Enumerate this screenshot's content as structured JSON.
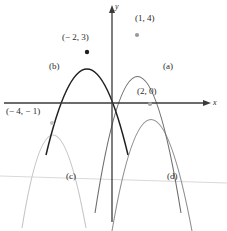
{
  "figure": {
    "background": "#ffffff",
    "axes": {
      "x_axis_label": "x",
      "y_axis_label": "y",
      "axis_color": "#3a3a3a",
      "origin_px": [
        112,
        103
      ],
      "unit_px": [
        12.6,
        17.0
      ],
      "x_axis_y_px": 103,
      "y_axis_x_px": 112
    },
    "point_labels": [
      {
        "name": "vertex-label-b",
        "text": "(− 2, 3)",
        "x_px": 62,
        "y_px": 33
      },
      {
        "name": "vertex-label-a",
        "text": "(1, 4)",
        "x_px": 135,
        "y_px": 14
      },
      {
        "name": "vertex-label-c",
        "text": "(− 4, − 1)",
        "x_px": 6,
        "y_px": 107
      },
      {
        "name": "vertex-label-d",
        "text": "(2, 0)",
        "x_px": 137,
        "y_px": 87
      }
    ],
    "curve_labels": [
      {
        "name": "curve-label-a",
        "text": "(a)",
        "x_px": 163,
        "y_px": 62
      },
      {
        "name": "curve-label-b",
        "text": "(b)",
        "x_px": 49,
        "y_px": 62
      },
      {
        "name": "curve-label-c",
        "text": "(c)",
        "x_px": 66,
        "y_px": 172
      },
      {
        "name": "curve-label-d",
        "text": "(d)",
        "x_px": 167,
        "y_px": 172
      }
    ],
    "curves": [
      {
        "id": "a",
        "label": "(a)",
        "vertex": [
          1,
          4
        ],
        "opens": "down",
        "color": "#6a6a6a",
        "width": 1.0
      },
      {
        "id": "b",
        "label": "(b)",
        "vertex": [
          -2,
          3
        ],
        "opens": "down",
        "color": "#1c1c1c",
        "width": 1.3
      },
      {
        "id": "c",
        "label": "(c)",
        "vertex": [
          -4,
          -1
        ],
        "opens": "down",
        "color": "#c2c2c2",
        "width": 1.0
      },
      {
        "id": "d",
        "label": "(d)",
        "vertex": [
          2,
          0
        ],
        "opens": "down",
        "color": "#8f8f8f",
        "width": 1.0
      }
    ],
    "vertex_dots": [
      {
        "name": "vertex-dot-a",
        "cx_px": 137,
        "cy_px": 35,
        "color": "#9a9a9a"
      },
      {
        "name": "vertex-dot-b",
        "cx_px": 87,
        "cy_px": 52,
        "color": "#1c1c1c"
      },
      {
        "name": "vertex-dot-c",
        "cx_px": 52,
        "cy_px": 123,
        "color": "#c4c4c4"
      },
      {
        "name": "vertex-dot-d",
        "cx_px": 150,
        "cy_px": 104,
        "color": "#a8a8a8"
      }
    ],
    "artifact": {
      "name": "scan-line",
      "description": "faint slanted horizontal scan line",
      "color": "#d8d8d8",
      "x1_px": 0,
      "y1_px": 176,
      "x2_px": 227,
      "y2_px": 183
    }
  }
}
